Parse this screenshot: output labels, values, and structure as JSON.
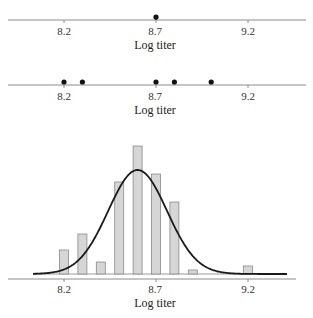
{
  "chart_data": [
    {
      "type": "scatter",
      "title": "",
      "xlabel": "Log titer",
      "ylabel": "",
      "xticks": [
        "8.2",
        "8.7",
        "9.2"
      ],
      "x": [
        8.7
      ],
      "y": [
        0
      ],
      "xlim": [
        7.9,
        9.45
      ]
    },
    {
      "type": "scatter",
      "title": "",
      "xlabel": "Log titer",
      "ylabel": "",
      "xticks": [
        "8.2",
        "8.7",
        "9.2"
      ],
      "x": [
        8.2,
        8.3,
        8.7,
        8.8,
        9.0
      ],
      "y": [
        0,
        0,
        0,
        0,
        0
      ],
      "xlim": [
        7.9,
        9.45
      ]
    },
    {
      "type": "bar",
      "title": "",
      "xlabel": "Log titer",
      "ylabel": "",
      "xticks": [
        "8.2",
        "8.7",
        "9.2"
      ],
      "categories": [
        "8.2",
        "8.3",
        "8.4",
        "8.5",
        "8.6",
        "8.7",
        "8.8",
        "8.9",
        "9.0",
        "9.1",
        "9.2"
      ],
      "values": [
        6,
        10,
        3,
        23,
        32,
        25,
        18,
        1,
        0,
        0,
        2
      ],
      "overlay": {
        "type": "line",
        "name": "normal curve",
        "mean": 8.6,
        "sd": 0.16,
        "peak": 26
      },
      "xlim": [
        7.9,
        9.45
      ]
    }
  ],
  "labels": {
    "plot1": {
      "ticks": [
        "8.2",
        "8.7",
        "9.2"
      ],
      "xlabel": "Log titer"
    },
    "plot2": {
      "ticks": [
        "8.2",
        "8.7",
        "9.2"
      ],
      "xlabel": "Log titer"
    },
    "plot3": {
      "ticks": [
        "8.2",
        "8.7",
        "9.2"
      ],
      "xlabel": "Log titer"
    }
  },
  "colors": {
    "bar_fill": "#d6d6d6",
    "bar_stroke": "#8a8a8a",
    "curve": "#1a1a1a",
    "axis": "#8c8c8c",
    "dot": "#111111"
  }
}
